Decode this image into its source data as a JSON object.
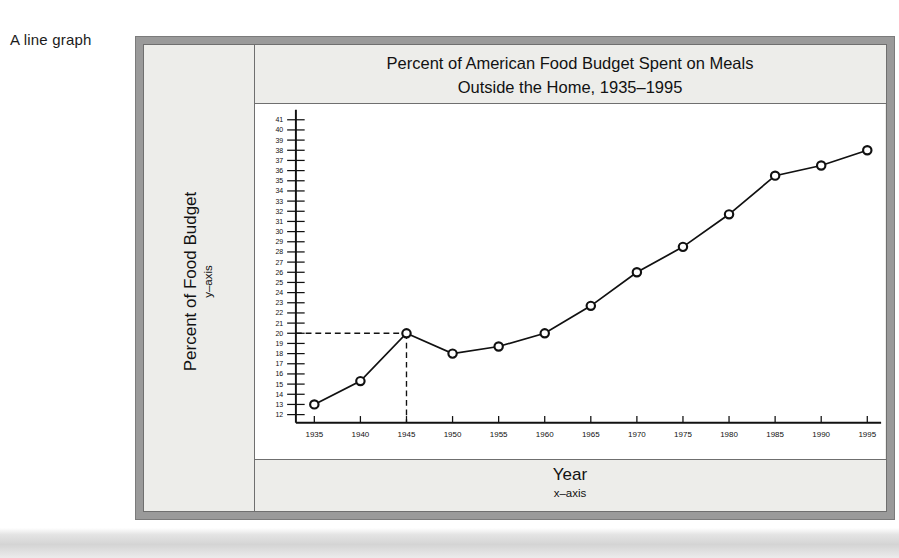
{
  "caption": "A line graph",
  "chart_data": {
    "type": "line",
    "title": "Percent of American Food Budget Spent on Meals Outside the Home, 1935–1995",
    "title_line1": "Percent of American Food Budget Spent on Meals",
    "title_line2": "Outside the Home, 1935–1995",
    "xlabel": "Year",
    "xlabel_sub": "x–axis",
    "ylabel": "Percent of Food Budget",
    "ylabel_sub": "y–axis",
    "x": [
      1935,
      1940,
      1945,
      1950,
      1955,
      1960,
      1965,
      1970,
      1975,
      1980,
      1985,
      1990,
      1995
    ],
    "values": [
      13,
      15.3,
      20,
      18,
      18.7,
      20,
      22.7,
      26,
      28.5,
      31.7,
      35.5,
      36.5,
      38
    ],
    "xticklabels": [
      "1935",
      "1940",
      "1945",
      "1950",
      "1955",
      "1960",
      "1965",
      "1970",
      "1975",
      "1980",
      "1985",
      "1990",
      "1995"
    ],
    "yticklabels": [
      "41",
      "40",
      "39",
      "38",
      "37",
      "36",
      "35",
      "34",
      "33",
      "32",
      "31",
      "30",
      "29",
      "28",
      "27",
      "26",
      "25",
      "24",
      "23",
      "22",
      "21",
      "20",
      "19",
      "18",
      "17",
      "16",
      "15",
      "14",
      "13",
      "12"
    ],
    "yticks": [
      41,
      40,
      39,
      38,
      37,
      36,
      35,
      34,
      33,
      32,
      31,
      30,
      29,
      28,
      27,
      26,
      25,
      24,
      23,
      22,
      21,
      20,
      19,
      18,
      17,
      16,
      15,
      14,
      13,
      12
    ],
    "xlim": [
      1933,
      1996.5
    ],
    "ylim": [
      11.2,
      41.8
    ],
    "grid": false,
    "legend": null,
    "annotations": [
      {
        "type": "guide-line",
        "style": "dashed",
        "from": "y-axis at 20",
        "to": "point (1945, 20)",
        "orientation": "horizontal"
      },
      {
        "type": "guide-line",
        "style": "dashed",
        "from": "point (1945, 20)",
        "to": "x-axis at 1945",
        "orientation": "vertical"
      }
    ],
    "marker": "open-circle",
    "line_color": "#111111",
    "marker_face_color": "#ffffff",
    "plot_background": "#ffffff"
  },
  "colors": {
    "frame_outer": "#9a9a9a",
    "panel": "#ededea",
    "rule": "#6f6f6f",
    "text": "#121212"
  }
}
